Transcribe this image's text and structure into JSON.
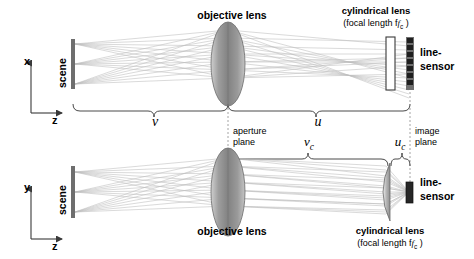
{
  "diagram": {
    "views": [
      {
        "id": "top-view",
        "plane": "x-z",
        "axis_vertical": "x",
        "axis_horizontal": "z",
        "scene_label": "scene",
        "objective_label": "objective lens",
        "cylindrical_label": "cylindrical lens",
        "cylindrical_sub": "(focal length f",
        "cylindrical_sub_idx": "c",
        "cylindrical_sub_close": " )",
        "sensor_label_1": "line-",
        "sensor_label_2": "sensor",
        "distance_labels": [
          "v",
          "u"
        ],
        "cyl_shape": "flat-plate",
        "note": "no optical power in x; rays pass straight through cylindrical lens onto extended line-sensor"
      },
      {
        "id": "bottom-view",
        "plane": "y-z",
        "axis_vertical": "y",
        "axis_horizontal": "z",
        "scene_label": "scene",
        "objective_label": "objective lens",
        "cylindrical_label": "cylindrical lens",
        "cylindrical_sub": "(focal length f",
        "cylindrical_sub_idx": "c",
        "cylindrical_sub_close": " )",
        "sensor_label_1": "line-",
        "sensor_label_2": "sensor",
        "distance_labels": [
          "v_c",
          "u_c"
        ],
        "cyl_shape": "plano-convex",
        "note": "cylindrical lens has power in y; rays converge to compact sensor"
      }
    ],
    "planes": [
      {
        "name": "aperture-plane",
        "line1": "aperture",
        "line2": "plane"
      },
      {
        "name": "image-plane",
        "line1": "image",
        "line2": "plane"
      }
    ],
    "distances": {
      "v": {
        "symbol": "v",
        "sub": "",
        "from": "scene",
        "to": "aperture plane",
        "view": "top"
      },
      "u": {
        "symbol": "u",
        "sub": "",
        "from": "aperture plane",
        "to": "image plane",
        "view": "top"
      },
      "vc": {
        "symbol": "v",
        "sub": "c",
        "from": "aperture plane",
        "to": "cylindrical lens",
        "view": "bottom"
      },
      "uc": {
        "symbol": "u",
        "sub": "c",
        "from": "cylindrical lens",
        "to": "image plane",
        "view": "bottom"
      }
    },
    "focal_symbol": {
      "symbol": "f",
      "sub": "c"
    },
    "colors": {
      "background": "#ffffff",
      "ink": "#000000",
      "ray": "#b4b4b4",
      "lens_fill": "#8a8a8a",
      "lens_edge": "#5a5a5a",
      "sensor": "#2b2b2b",
      "scene_bar": "#6e6e6e",
      "brace": "#4a4a4a",
      "dashed_plane": "#9a9a9a"
    },
    "ray_fan_count": 3,
    "rays_per_fan": 7
  }
}
